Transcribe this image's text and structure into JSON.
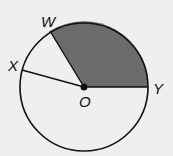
{
  "diagram": {
    "type": "circle-sector",
    "center": {
      "label": "O",
      "x": 84,
      "y": 87
    },
    "radius": 64,
    "points": [
      {
        "label": "W",
        "x": 50,
        "y": 31
      },
      {
        "label": "X",
        "x": 22,
        "y": 70
      },
      {
        "label": "Y",
        "x": 148,
        "y": 87
      }
    ],
    "shaded_sector": {
      "from": "W",
      "to": "Y",
      "color": "#6b6b6b"
    },
    "background": "#efefef",
    "stroke": "#111111"
  }
}
